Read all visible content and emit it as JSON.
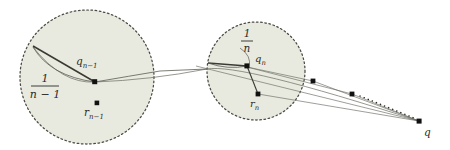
{
  "figure": {
    "background_color": "#ffffff",
    "disk_fill_color": "#e8e9df",
    "disk_border_color": "#4a4a42",
    "line_color": "#4f4f48",
    "point_color": "#111111",
    "text_color": "#2b2b26"
  },
  "disks": [
    {
      "id": "disk-n-minus-1",
      "cx": 87,
      "cy": 77,
      "r": 67,
      "radius_label_numerator": "1",
      "radius_label_denominator": "n − 1",
      "center_point": {
        "x": 97,
        "y": 103,
        "label": "r",
        "sub": "n−1"
      },
      "vertex_point": {
        "x": 95,
        "y": 82,
        "label": "q",
        "sub": "n−1"
      }
    },
    {
      "id": "disk-n",
      "cx": 256,
      "cy": 71,
      "r": 49,
      "radius_label_numerator": "1",
      "radius_label_denominator": "n",
      "center_point": {
        "x": 258,
        "y": 94,
        "label": "r",
        "sub": "n"
      },
      "vertex_point": {
        "x": 247,
        "y": 66,
        "label": "q",
        "sub": "n"
      }
    }
  ],
  "sequence_points": [
    {
      "id": "seq-dot-1",
      "x": 313,
      "y": 81
    },
    {
      "id": "seq-dot-2",
      "x": 352,
      "y": 94
    }
  ],
  "limit_point": {
    "id": "limit-point-q",
    "x": 419,
    "y": 121,
    "label": "q"
  },
  "labels": {
    "q_n_minus_1": "q",
    "q_n_minus_1_sub": "n−1",
    "r_n_minus_1": "r",
    "r_n_minus_1_sub": "n−1",
    "q_n": "q",
    "q_n_sub": "n",
    "r_n": "r",
    "r_n_sub": "n",
    "q": "q",
    "frac_one_a": "1",
    "frac_nminus1": "n − 1",
    "frac_one_b": "1",
    "frac_n": "n"
  }
}
